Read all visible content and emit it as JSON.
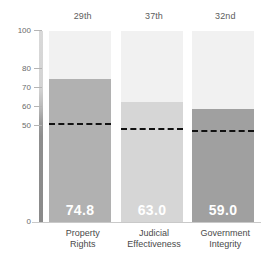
{
  "chart_data": {
    "type": "bar",
    "title": "",
    "subtitle": "",
    "xlabel": "",
    "ylabel": "",
    "ylim": [
      0,
      100
    ],
    "grid": false,
    "legend_position": "none",
    "categories": [
      "Property Rights",
      "Judicial Effectiveness",
      "Government Integrity"
    ],
    "category_lines": [
      [
        "Property",
        "Rights"
      ],
      [
        "Judicial",
        "Effectiveness"
      ],
      [
        "Government",
        "Integrity"
      ]
    ],
    "values": [
      74.8,
      63.0,
      59.0
    ],
    "value_labels": [
      "74.8",
      "63.0",
      "59.0"
    ],
    "ranks": [
      "29th",
      "37th",
      "32nd"
    ],
    "reference_lines": [
      51.0,
      48.0,
      47.0
    ],
    "bar_colors": [
      "#b1b1b1",
      "#d6d6d6",
      "#a0a0a0"
    ],
    "column_background": "#f1f1f1",
    "ytick_values": [
      100,
      80,
      70,
      60,
      50,
      0
    ],
    "ytick_labels": [
      "100",
      "80",
      "70",
      "60",
      "50",
      "0"
    ],
    "axis_label_color": "#6a6a6a",
    "value_label_color": "#ffffff",
    "reference_line_color": "#111111"
  }
}
